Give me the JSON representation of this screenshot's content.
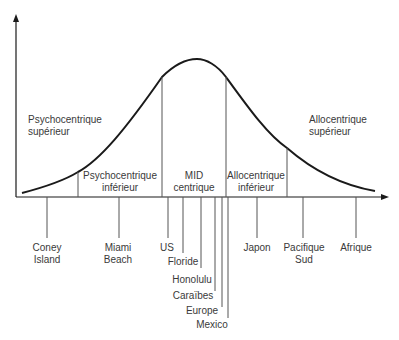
{
  "diagram": {
    "type": "bell-curve-segmented",
    "regions": [
      {
        "id": "psycho-sup",
        "line1": "Psychocentrique",
        "line2": "supérieur"
      },
      {
        "id": "psycho-inf",
        "line1": "Psychocentrique",
        "line2": "inférieur"
      },
      {
        "id": "mid",
        "line1": "MID",
        "line2": "centrique"
      },
      {
        "id": "allo-inf",
        "line1": "Allocentrique",
        "line2": "inférieur"
      },
      {
        "id": "allo-sup",
        "line1": "Allocentrique",
        "line2": "supérieur"
      }
    ],
    "destinations": [
      {
        "line1": "Coney",
        "line2": "Island"
      },
      {
        "line1": "Miami",
        "line2": "Beach"
      },
      {
        "line1": "US"
      },
      {
        "line1": "Floride"
      },
      {
        "line1": "Honolulu"
      },
      {
        "line1": "Caraïbes"
      },
      {
        "line1": "Europe"
      },
      {
        "line1": "Mexico"
      },
      {
        "line1": "Japon"
      },
      {
        "line1": "Pacifique",
        "line2": "Sud"
      },
      {
        "line1": "Afrique"
      }
    ],
    "colors": {
      "line": "#1a1a1a",
      "thin": "#555555",
      "text": "#3a3a3a"
    }
  }
}
